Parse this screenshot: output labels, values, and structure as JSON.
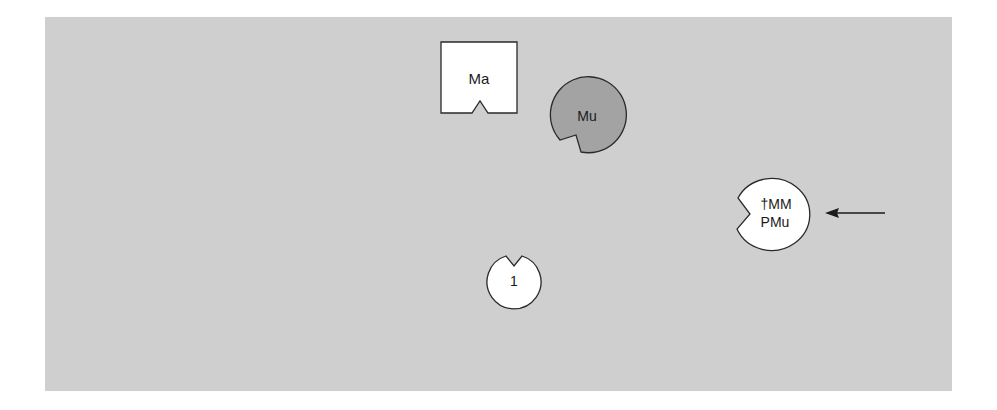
{
  "diagram": {
    "background_color": "#cfcfcf",
    "nodes": [
      {
        "id": "ma",
        "shape": "square-notched-bottom",
        "label": "Ma",
        "fill": "#ffffff"
      },
      {
        "id": "mu",
        "shape": "circle-notched-bottom-left",
        "label": "Mu",
        "fill": "#a3a3a3"
      },
      {
        "id": "pmu",
        "shape": "circle-notched-left",
        "label_line1": "†MM",
        "label_line2": "PMu",
        "fill": "#ffffff"
      },
      {
        "id": "one",
        "shape": "circle-notched-top",
        "label": "1",
        "fill": "#ffffff"
      }
    ],
    "arrow": {
      "direction": "left",
      "points_to": "pmu"
    }
  }
}
